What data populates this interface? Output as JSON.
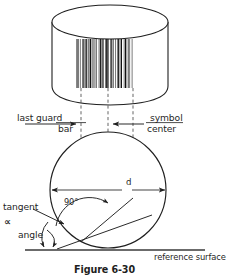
{
  "figure": {
    "caption": "Figure 6-30",
    "background_color": "#ffffff",
    "ink_color": "#1f1f1f"
  },
  "labels": {
    "last_guard": "last guard",
    "bar": "bar",
    "symbol": "symbol",
    "center": "center",
    "diameter": "d",
    "right_angle": "90°",
    "tangent": "tangent",
    "alpha": "∝",
    "angle": "angle",
    "reference_surface": "reference surface"
  },
  "upper_diagram": {
    "name": "cylinder-with-barcode",
    "barcode": {
      "name": "barcode-symbol",
      "bar_widths": [
        2,
        1,
        1,
        2,
        1,
        3,
        1,
        1,
        2,
        1,
        1,
        1,
        2,
        2,
        1,
        1,
        3,
        1,
        1,
        2,
        1,
        1,
        1,
        2,
        1,
        3,
        1,
        1,
        2,
        1,
        2,
        1,
        1,
        2,
        1,
        1,
        3,
        1,
        1,
        2,
        1,
        1,
        2,
        1,
        1,
        3,
        1,
        2,
        1,
        1,
        2,
        1,
        1,
        1,
        2,
        3,
        1,
        1,
        2,
        1,
        1,
        2,
        1,
        1,
        1,
        3,
        1,
        2
      ]
    }
  },
  "lower_diagram": {
    "name": "circle-cross-section",
    "reference_surface_label": "reference surface"
  }
}
